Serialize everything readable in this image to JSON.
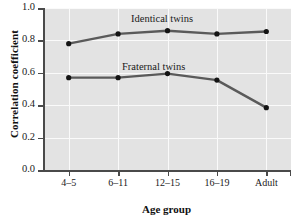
{
  "chart_data": {
    "type": "line",
    "title": "",
    "xlabel": "Age group",
    "ylabel": "Correlation coefficient",
    "categories": [
      "4–5",
      "6–11",
      "12–15",
      "16–19",
      "Adult"
    ],
    "ylim": [
      0.0,
      1.0
    ],
    "yticks": [
      "0.0",
      "0.2",
      "0.4",
      "0.6",
      "0.8",
      "1.0"
    ],
    "ytick_values": [
      0.0,
      0.2,
      0.4,
      0.6,
      0.8,
      1.0
    ],
    "grid": "white gridlines on gray panel, horizontal and vertical",
    "legend_position": "inline labels above each series",
    "series": [
      {
        "name": "Identical twins",
        "values": [
          0.78,
          0.84,
          0.86,
          0.84,
          0.855
        ],
        "color": "#5a5a5a",
        "marker_color": "#141414"
      },
      {
        "name": "Fraternal twins",
        "values": [
          0.57,
          0.57,
          0.595,
          0.555,
          0.385
        ],
        "color": "#5a5a5a",
        "marker_color": "#141414"
      }
    ]
  },
  "labels": {
    "identical": "Identical twins",
    "fraternal": "Fraternal twins"
  },
  "style": {
    "panel_background": "#e3e3e3",
    "gridline_color": "#fafafa",
    "axis_color": "#4a4a4a",
    "text_color": "#1a1a1a"
  }
}
